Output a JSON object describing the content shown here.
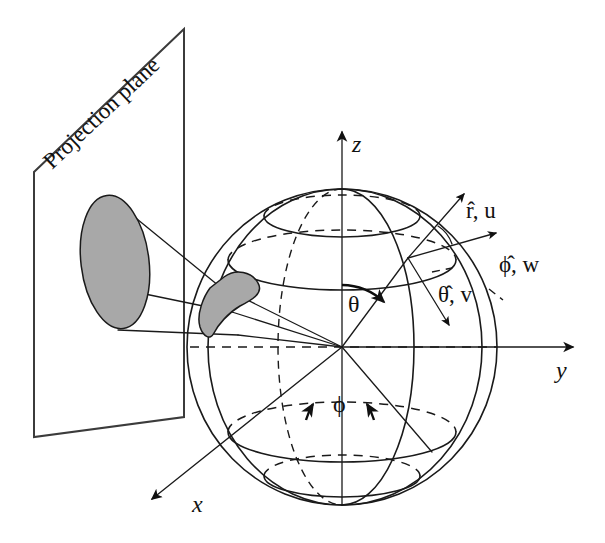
{
  "figure": {
    "background_color": "#ffffff",
    "ink_color": "#1a1a1a",
    "shade_color": "#a8a8a8"
  },
  "labels": {
    "projection_plane": "Projection plane",
    "axis_x": "x",
    "axis_y": "y",
    "axis_z": "z",
    "angle_theta": "θ",
    "angle_phi": "ϕ",
    "vector_r": "r̂, u",
    "vector_phi": "ϕ̂, w",
    "vector_theta": "θ̂, v"
  },
  "geometry": {
    "sphere_center": {
      "x": 342,
      "y": 347
    },
    "sphere_radius_x": 155,
    "sphere_radius_y": 158,
    "surface_point": {
      "x": 408,
      "y": 258
    },
    "projection_plane_corners": [
      {
        "x": 184,
        "y": 29
      },
      {
        "x": 34,
        "y": 172
      },
      {
        "x": 34,
        "y": 437
      },
      {
        "x": 184,
        "y": 417
      }
    ],
    "projected_ellipse": {
      "cx": 115,
      "cy": 262,
      "rx": 34,
      "ry": 67
    },
    "axis_z_tip": {
      "x": 342,
      "y": 125
    },
    "axis_y_tip": {
      "x": 580,
      "y": 347
    },
    "axis_x_tip": {
      "x": 148,
      "y": 503
    }
  },
  "vectors": {
    "r_hat": {
      "from": {
        "x": 408,
        "y": 258
      },
      "to": {
        "x": 468,
        "y": 190
      }
    },
    "phi_hat": {
      "from": {
        "x": 408,
        "y": 258
      },
      "to": {
        "x": 500,
        "y": 232
      }
    },
    "theta_hat": {
      "from": {
        "x": 408,
        "y": 258
      },
      "to": {
        "x": 452,
        "y": 330
      }
    }
  }
}
